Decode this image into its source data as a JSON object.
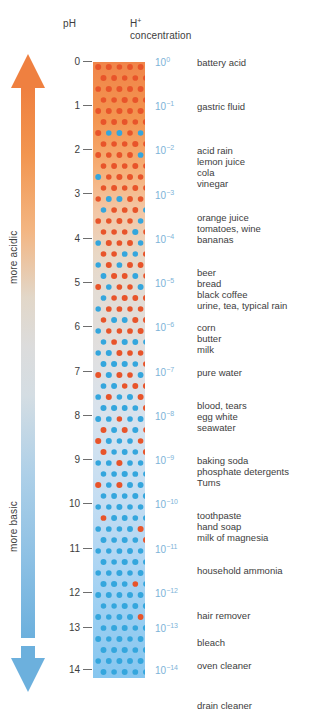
{
  "headers": {
    "ph": "pH",
    "concentration_line1": "H",
    "concentration_sup": "+",
    "concentration_line2": "concentration"
  },
  "axis_arrow": {
    "top_label": "more acidic",
    "bottom_label": "more basic",
    "top_color": "#f08a4d",
    "bottom_color": "#6cb0dd",
    "mid_color": "#dcdcdc"
  },
  "colors": {
    "acid_dot": "#e8542a",
    "base_dot": "#34a6dd",
    "exponent_text": "#7db3d8",
    "label_text": "#3d3d3d",
    "bar_top": "#f0854a",
    "bar_bottom": "#86c6ef"
  },
  "ph_ticks": [
    "0",
    "1",
    "2",
    "3",
    "4",
    "5",
    "6",
    "7",
    "8",
    "9",
    "10",
    "11",
    "12",
    "13",
    "14"
  ],
  "chart_data": {
    "type": "table",
    "xlabel": "",
    "ylabel": "pH",
    "ylim": [
      0,
      14
    ],
    "rows": [
      {
        "ph": "0",
        "exp_base": "10",
        "exp_sup": "0",
        "items": [
          "battery acid"
        ]
      },
      {
        "ph": "1",
        "exp_base": "10",
        "exp_sup": "−1",
        "items": [
          "gastric fluid"
        ]
      },
      {
        "ph": "2",
        "exp_base": "10",
        "exp_sup": "−2",
        "items": [
          "acid rain",
          "lemon juice",
          "cola"
        ]
      },
      {
        "ph": "3",
        "exp_base": "10",
        "exp_sup": "−3",
        "items": [
          "vinegar"
        ]
      },
      {
        "ph": "4",
        "exp_base": "10",
        "exp_sup": "−4",
        "items": [
          "orange juice",
          "tomatoes, wine",
          "bananas"
        ]
      },
      {
        "ph": "5",
        "exp_base": "10",
        "exp_sup": "−5",
        "items": [
          "beer",
          "bread",
          "black coffee",
          "urine, tea, typical rain"
        ]
      },
      {
        "ph": "6",
        "exp_base": "10",
        "exp_sup": "−6",
        "items": [
          "corn",
          "butter",
          "milk"
        ]
      },
      {
        "ph": "7",
        "exp_base": "10",
        "exp_sup": "−7",
        "items": [
          "pure water"
        ]
      },
      {
        "ph": "8",
        "exp_base": "10",
        "exp_sup": "−8",
        "items": [
          "blood, tears",
          "egg white",
          "seawater"
        ]
      },
      {
        "ph": "9",
        "exp_base": "10",
        "exp_sup": "−9",
        "items": [
          "baking soda",
          "phosphate detergents",
          "Tums"
        ]
      },
      {
        "ph": "10",
        "exp_base": "10",
        "exp_sup": "−10",
        "items": [
          "toothpaste",
          "hand soap",
          "milk of magnesia"
        ]
      },
      {
        "ph": "11",
        "exp_base": "10",
        "exp_sup": "−11",
        "items": [
          "household ammonia"
        ]
      },
      {
        "ph": "12",
        "exp_base": "10",
        "exp_sup": "−12",
        "items": [
          "hair remover"
        ]
      },
      {
        "ph": "13",
        "exp_base": "10",
        "exp_sup": "−13",
        "items": [
          "bleach",
          "oven cleaner"
        ]
      },
      {
        "ph": "14",
        "exp_base": "10",
        "exp_sup": "−14",
        "items": [
          "drain cleaner"
        ]
      }
    ]
  },
  "positions": {
    "ticks_y": [
      62,
      106,
      150,
      194,
      239,
      283,
      327,
      372,
      416,
      460,
      504,
      549,
      593,
      628,
      670
    ],
    "expo_y": [
      57,
      101,
      145,
      190,
      234,
      278,
      322,
      367,
      411,
      455,
      499,
      544,
      588,
      623,
      665
    ],
    "items_y": [
      [
        57
      ],
      [
        101
      ],
      [
        145,
        156,
        167
      ],
      [
        178
      ],
      [
        212,
        223,
        234
      ],
      [
        267,
        278,
        289,
        300
      ],
      [
        322,
        333,
        344
      ],
      [
        367
      ],
      [
        400,
        411,
        422
      ],
      [
        455,
        466,
        477
      ],
      [
        510,
        521,
        532
      ],
      [
        565
      ],
      [
        610
      ],
      [
        637,
        660
      ],
      [
        700
      ]
    ]
  }
}
